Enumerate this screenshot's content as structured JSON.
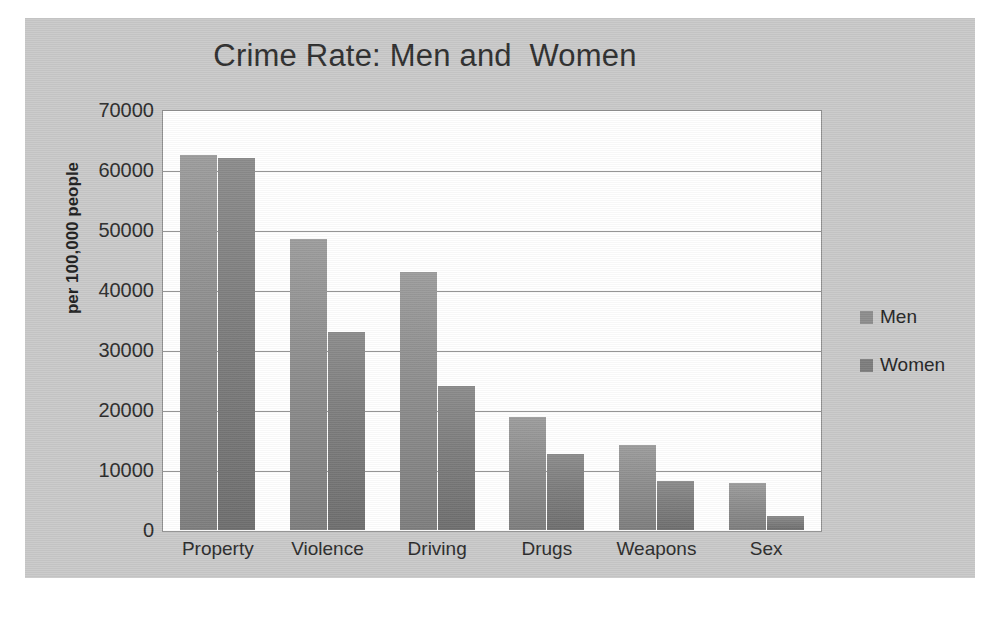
{
  "chart_data": {
    "type": "bar",
    "title": "Crime Rate: Men and  Women",
    "xlabel": "",
    "ylabel": "per 100,000 people",
    "categories": [
      "Property",
      "Violence",
      "Driving",
      "Drugs",
      "Weapons",
      "Sex"
    ],
    "series": [
      {
        "name": "Men",
        "values": [
          62500,
          48500,
          43000,
          18800,
          14200,
          7800
        ],
        "color": "#8d8d8d"
      },
      {
        "name": "Women",
        "values": [
          62000,
          33000,
          24000,
          12700,
          8200,
          2300
        ],
        "color": "#7d7d7d"
      }
    ],
    "ylim": [
      0,
      70000
    ],
    "ytick_values": [
      70000,
      60000,
      50000,
      40000,
      30000,
      20000,
      10000,
      0
    ],
    "ytick_labels": [
      "70000",
      "60000",
      "50000",
      "40000",
      "30000",
      "20000",
      "10000",
      "0"
    ],
    "grid": true,
    "legend_position": "right",
    "plot_background": "#ffffff",
    "panel_background": "#c9c9c9",
    "gridline_color": "#8f8f8f"
  },
  "legend": {
    "entries": [
      {
        "label": "Men"
      },
      {
        "label": "Women"
      }
    ]
  },
  "caption_fragment": ""
}
